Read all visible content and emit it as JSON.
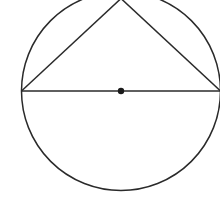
{
  "diagram": {
    "type": "geometry",
    "colors": {
      "stroke": "#2a2a2a",
      "background": "#ffffff"
    },
    "circle": {
      "cx": 121,
      "cy": 91,
      "r": 99.5
    },
    "center_point": {
      "x": 121,
      "y": 91,
      "r": 3.2
    },
    "diameter": {
      "x1": 21.5,
      "y1": 91,
      "x2": 220.5,
      "y2": 91
    },
    "triangle": {
      "apex": {
        "x": 121,
        "y": -1.5
      },
      "left": {
        "x": 21.5,
        "y": 91
      },
      "right": {
        "x": 220.5,
        "y": 91
      }
    }
  }
}
